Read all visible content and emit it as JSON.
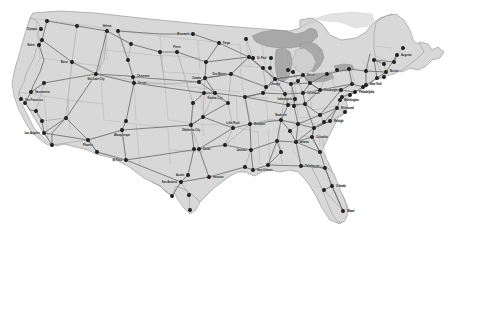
{
  "map": {
    "title": "United States Interstate Highway Map",
    "background_color": "#ffffff",
    "land_color": "#d8d8d8",
    "land_stroke": "#9a9a9a",
    "water_color": "#a8a8a8",
    "water_stroke": "#8c8c8c",
    "state_border_color": "#b2b2b2",
    "interstate_color": "#6e6e6e",
    "highway_color": "#8a8a8a",
    "city_dot_color": "#222222",
    "label_color": "#1a1a1a",
    "projection_note": "conic lower-48"
  },
  "legend": {
    "items": []
  },
  "cities": [
    {
      "name": "Seattle",
      "x": 47,
      "y": 21
    },
    {
      "name": "Olympia",
      "x": 41,
      "y": 29
    },
    {
      "name": "Spokane",
      "x": 77,
      "y": 26
    },
    {
      "name": "Portland",
      "x": 42,
      "y": 40
    },
    {
      "name": "Salem",
      "x": 39,
      "y": 45
    },
    {
      "name": "Boise",
      "x": 72,
      "y": 62
    },
    {
      "name": "Helena",
      "x": 107,
      "y": 31
    },
    {
      "name": "Billings",
      "x": 131,
      "y": 44
    },
    {
      "name": "Great Falls",
      "x": 118,
      "y": 31
    },
    {
      "name": "Bismarck",
      "x": 193,
      "y": 34
    },
    {
      "name": "Fargo",
      "x": 219,
      "y": 43
    },
    {
      "name": "Duluth",
      "x": 246,
      "y": 39
    },
    {
      "name": "Minneapolis",
      "x": 249,
      "y": 57
    },
    {
      "name": "St. Paul",
      "x": 253,
      "y": 58
    },
    {
      "name": "Rapid City",
      "x": 160,
      "y": 52
    },
    {
      "name": "Sioux Falls",
      "x": 206,
      "y": 62
    },
    {
      "name": "Pierre",
      "x": 177,
      "y": 52
    },
    {
      "name": "Casper",
      "x": 128,
      "y": 60
    },
    {
      "name": "Cheyenne",
      "x": 133,
      "y": 77
    },
    {
      "name": "Denver",
      "x": 134,
      "y": 83
    },
    {
      "name": "Salt Lake City",
      "x": 96,
      "y": 74
    },
    {
      "name": "Reno",
      "x": 44,
      "y": 83
    },
    {
      "name": "Sacramento",
      "x": 31,
      "y": 92
    },
    {
      "name": "San Francisco",
      "x": 21,
      "y": 99
    },
    {
      "name": "San Jose",
      "x": 25,
      "y": 103
    },
    {
      "name": "Fresno",
      "x": 36,
      "y": 111
    },
    {
      "name": "Bakersfield",
      "x": 42,
      "y": 121
    },
    {
      "name": "Los Angeles",
      "x": 44,
      "y": 133
    },
    {
      "name": "San Diego",
      "x": 52,
      "y": 145
    },
    {
      "name": "Las Vegas",
      "x": 66,
      "y": 118
    },
    {
      "name": "Phoenix",
      "x": 88,
      "y": 140
    },
    {
      "name": "Tucson",
      "x": 97,
      "y": 152
    },
    {
      "name": "Albuquerque",
      "x": 122,
      "y": 130
    },
    {
      "name": "Santa Fe",
      "x": 126,
      "y": 121
    },
    {
      "name": "El Paso",
      "x": 126,
      "y": 160
    },
    {
      "name": "Omaha",
      "x": 205,
      "y": 78
    },
    {
      "name": "Lincoln",
      "x": 199,
      "y": 82
    },
    {
      "name": "Des Moines",
      "x": 231,
      "y": 74
    },
    {
      "name": "Kansas City",
      "x": 215,
      "y": 93
    },
    {
      "name": "Topeka",
      "x": 204,
      "y": 93
    },
    {
      "name": "Wichita",
      "x": 193,
      "y": 103
    },
    {
      "name": "Oklahoma City",
      "x": 191,
      "y": 125
    },
    {
      "name": "Tulsa",
      "x": 203,
      "y": 117
    },
    {
      "name": "Dallas",
      "x": 199,
      "y": 149
    },
    {
      "name": "Fort Worth",
      "x": 194,
      "y": 149
    },
    {
      "name": "Austin",
      "x": 188,
      "y": 175
    },
    {
      "name": "San Antonio",
      "x": 181,
      "y": 182
    },
    {
      "name": "Houston",
      "x": 209,
      "y": 177
    },
    {
      "name": "Corpus Christi",
      "x": 189,
      "y": 195
    },
    {
      "name": "Laredo",
      "x": 172,
      "y": 196
    },
    {
      "name": "Brownsville",
      "x": 190,
      "y": 210
    },
    {
      "name": "Springfield",
      "x": 228,
      "y": 103
    },
    {
      "name": "St. Louis",
      "x": 245,
      "y": 97
    },
    {
      "name": "Little Rock",
      "x": 233,
      "y": 128
    },
    {
      "name": "Memphis",
      "x": 250,
      "y": 124
    },
    {
      "name": "Jackson",
      "x": 251,
      "y": 150
    },
    {
      "name": "Shreveport",
      "x": 225,
      "y": 145
    },
    {
      "name": "Baton Rouge",
      "x": 245,
      "y": 167
    },
    {
      "name": "New Orleans",
      "x": 253,
      "y": 170
    },
    {
      "name": "Mobile",
      "x": 268,
      "y": 165
    },
    {
      "name": "Birmingham",
      "x": 277,
      "y": 141
    },
    {
      "name": "Montgomery",
      "x": 281,
      "y": 152
    },
    {
      "name": "Nashville",
      "x": 281,
      "y": 120
    },
    {
      "name": "Chattanooga",
      "x": 290,
      "y": 131
    },
    {
      "name": "Atlanta",
      "x": 296,
      "y": 142
    },
    {
      "name": "Savannah",
      "x": 320,
      "y": 152
    },
    {
      "name": "Jacksonville",
      "x": 325,
      "y": 168
    },
    {
      "name": "Orlando",
      "x": 332,
      "y": 186
    },
    {
      "name": "Tampa",
      "x": 324,
      "y": 190
    },
    {
      "name": "Miami",
      "x": 343,
      "y": 211
    },
    {
      "name": "Tallahassee",
      "x": 301,
      "y": 166
    },
    {
      "name": "Columbia",
      "x": 312,
      "y": 137
    },
    {
      "name": "Charlotte",
      "x": 314,
      "y": 128
    },
    {
      "name": "Raleigh",
      "x": 330,
      "y": 121
    },
    {
      "name": "Charleston WV",
      "x": 305,
      "y": 104
    },
    {
      "name": "Richmond",
      "x": 337,
      "y": 108
    },
    {
      "name": "Norfolk",
      "x": 345,
      "y": 112
    },
    {
      "name": "Washington",
      "x": 340,
      "y": 100
    },
    {
      "name": "Baltimore",
      "x": 342,
      "y": 97
    },
    {
      "name": "Philadelphia",
      "x": 355,
      "y": 92
    },
    {
      "name": "Wilmington",
      "x": 350,
      "y": 95
    },
    {
      "name": "New York",
      "x": 366,
      "y": 85
    },
    {
      "name": "Newark",
      "x": 363,
      "y": 87
    },
    {
      "name": "Hartford",
      "x": 377,
      "y": 78
    },
    {
      "name": "Providence",
      "x": 384,
      "y": 77
    },
    {
      "name": "Boston",
      "x": 386,
      "y": 72
    },
    {
      "name": "Albany",
      "x": 366,
      "y": 71
    },
    {
      "name": "Concord",
      "x": 384,
      "y": 64
    },
    {
      "name": "Montpelier",
      "x": 374,
      "y": 60
    },
    {
      "name": "Augusta",
      "x": 397,
      "y": 55
    },
    {
      "name": "Portland ME",
      "x": 394,
      "y": 62
    },
    {
      "name": "Bangor",
      "x": 403,
      "y": 48
    },
    {
      "name": "Buffalo",
      "x": 327,
      "y": 74
    },
    {
      "name": "Rochester",
      "x": 337,
      "y": 70
    },
    {
      "name": "Syracuse",
      "x": 349,
      "y": 69
    },
    {
      "name": "Scranton",
      "x": 352,
      "y": 84
    },
    {
      "name": "Harrisburg",
      "x": 341,
      "y": 90
    },
    {
      "name": "Pittsburgh",
      "x": 320,
      "y": 90
    },
    {
      "name": "Cleveland",
      "x": 310,
      "y": 83
    },
    {
      "name": "Columbus",
      "x": 303,
      "y": 93
    },
    {
      "name": "Cincinnati",
      "x": 295,
      "y": 99
    },
    {
      "name": "Toledo",
      "x": 298,
      "y": 81
    },
    {
      "name": "Detroit",
      "x": 303,
      "y": 75
    },
    {
      "name": "Lansing",
      "x": 293,
      "y": 72
    },
    {
      "name": "Grand Rapids",
      "x": 288,
      "y": 70
    },
    {
      "name": "Indianapolis",
      "x": 285,
      "y": 94
    },
    {
      "name": "Fort Wayne",
      "x": 291,
      "y": 84
    },
    {
      "name": "Chicago",
      "x": 275,
      "y": 79
    },
    {
      "name": "Milwaukee",
      "x": 270,
      "y": 68
    },
    {
      "name": "Madison",
      "x": 263,
      "y": 68
    },
    {
      "name": "Green Bay",
      "x": 271,
      "y": 58
    },
    {
      "name": "Louisville",
      "x": 288,
      "y": 105
    },
    {
      "name": "Lexington",
      "x": 294,
      "y": 106
    },
    {
      "name": "Knoxville",
      "x": 298,
      "y": 124
    },
    {
      "name": "Roanoke",
      "x": 320,
      "y": 115
    },
    {
      "name": "Greensboro",
      "x": 324,
      "y": 122
    },
    {
      "name": "Peoria",
      "x": 266,
      "y": 87
    },
    {
      "name": "Springfield IL",
      "x": 263,
      "y": 93
    }
  ],
  "visible_labels": [
    {
      "name": "Olympia",
      "x": 41,
      "y": 29,
      "anchor": "end",
      "dx": -4,
      "dy": 1
    },
    {
      "name": "Boise",
      "x": 72,
      "y": 62,
      "anchor": "end",
      "dx": -4,
      "dy": 1
    },
    {
      "name": "Salem",
      "x": 39,
      "y": 45,
      "anchor": "end",
      "dx": -4,
      "dy": 1
    },
    {
      "name": "Helena",
      "x": 107,
      "y": 31,
      "anchor": "middle",
      "dx": 0,
      "dy": -4
    },
    {
      "name": "Bismarck",
      "x": 193,
      "y": 34,
      "anchor": "end",
      "dx": -4,
      "dy": 1
    },
    {
      "name": "Fargo",
      "x": 219,
      "y": 43,
      "anchor": "start",
      "dx": 4,
      "dy": 1
    },
    {
      "name": "Pierre",
      "x": 177,
      "y": 52,
      "anchor": "middle",
      "dx": 0,
      "dy": -4
    },
    {
      "name": "Salt Lake City",
      "x": 96,
      "y": 74,
      "anchor": "middle",
      "dx": 0,
      "dy": 6
    },
    {
      "name": "Denver",
      "x": 134,
      "y": 83,
      "anchor": "start",
      "dx": 4,
      "dy": 1
    },
    {
      "name": "Cheyenne",
      "x": 133,
      "y": 77,
      "anchor": "start",
      "dx": 4,
      "dy": 0
    },
    {
      "name": "Sacramento",
      "x": 31,
      "y": 92,
      "anchor": "start",
      "dx": 4,
      "dy": 1
    },
    {
      "name": "San Francisco",
      "x": 21,
      "y": 99,
      "anchor": "start",
      "dx": 4,
      "dy": 2
    },
    {
      "name": "Los Angeles",
      "x": 44,
      "y": 133,
      "anchor": "end",
      "dx": -4,
      "dy": 1
    },
    {
      "name": "Phoenix",
      "x": 88,
      "y": 140,
      "anchor": "middle",
      "dx": 0,
      "dy": 6
    },
    {
      "name": "Albuquerque",
      "x": 122,
      "y": 130,
      "anchor": "middle",
      "dx": 0,
      "dy": 6
    },
    {
      "name": "El Paso",
      "x": 126,
      "y": 160,
      "anchor": "end",
      "dx": -4,
      "dy": 1
    },
    {
      "name": "St. Paul",
      "x": 253,
      "y": 58,
      "anchor": "start",
      "dx": 4,
      "dy": 1
    },
    {
      "name": "Des Moines",
      "x": 231,
      "y": 74,
      "anchor": "end",
      "dx": -4,
      "dy": 1
    },
    {
      "name": "Omaha",
      "x": 205,
      "y": 78,
      "anchor": "end",
      "dx": -4,
      "dy": 1
    },
    {
      "name": "Kansas City",
      "x": 215,
      "y": 93,
      "anchor": "middle",
      "dx": 0,
      "dy": 6
    },
    {
      "name": "Oklahoma City",
      "x": 191,
      "y": 125,
      "anchor": "middle",
      "dx": 0,
      "dy": 6
    },
    {
      "name": "Dallas",
      "x": 199,
      "y": 149,
      "anchor": "start",
      "dx": 4,
      "dy": 1
    },
    {
      "name": "Austin",
      "x": 188,
      "y": 175,
      "anchor": "end",
      "dx": -4,
      "dy": 1
    },
    {
      "name": "San Antonio",
      "x": 181,
      "y": 182,
      "anchor": "end",
      "dx": -4,
      "dy": 1
    },
    {
      "name": "Houston",
      "x": 209,
      "y": 177,
      "anchor": "start",
      "dx": 4,
      "dy": 1
    },
    {
      "name": "Little Rock",
      "x": 233,
      "y": 128,
      "anchor": "middle",
      "dx": 0,
      "dy": -4
    },
    {
      "name": "Memphis",
      "x": 250,
      "y": 124,
      "anchor": "start",
      "dx": 4,
      "dy": 1
    },
    {
      "name": "New Orleans",
      "x": 253,
      "y": 170,
      "anchor": "start",
      "dx": 4,
      "dy": 1
    },
    {
      "name": "Jackson",
      "x": 251,
      "y": 150,
      "anchor": "end",
      "dx": -4,
      "dy": 1
    },
    {
      "name": "Nashville",
      "x": 281,
      "y": 120,
      "anchor": "middle",
      "dx": 0,
      "dy": -4
    },
    {
      "name": "Atlanta",
      "x": 296,
      "y": 142,
      "anchor": "start",
      "dx": 4,
      "dy": 1
    },
    {
      "name": "Tallahassee",
      "x": 301,
      "y": 166,
      "anchor": "start",
      "dx": 4,
      "dy": 1
    },
    {
      "name": "Orlando",
      "x": 332,
      "y": 186,
      "anchor": "start",
      "dx": 4,
      "dy": 1
    },
    {
      "name": "Miami",
      "x": 343,
      "y": 211,
      "anchor": "start",
      "dx": 4,
      "dy": 1
    },
    {
      "name": "Raleigh",
      "x": 330,
      "y": 121,
      "anchor": "start",
      "dx": 4,
      "dy": 1
    },
    {
      "name": "Columbia",
      "x": 312,
      "y": 137,
      "anchor": "start",
      "dx": 4,
      "dy": 1
    },
    {
      "name": "Richmond",
      "x": 337,
      "y": 108,
      "anchor": "start",
      "dx": 4,
      "dy": 1
    },
    {
      "name": "Washington",
      "x": 340,
      "y": 100,
      "anchor": "start",
      "dx": 4,
      "dy": 1
    },
    {
      "name": "Philadelphia",
      "x": 355,
      "y": 92,
      "anchor": "start",
      "dx": 4,
      "dy": 1
    },
    {
      "name": "New York",
      "x": 366,
      "y": 85,
      "anchor": "start",
      "dx": 4,
      "dy": 0
    },
    {
      "name": "Boston",
      "x": 386,
      "y": 72,
      "anchor": "start",
      "dx": 4,
      "dy": 0
    },
    {
      "name": "Augusta",
      "x": 397,
      "y": 55,
      "anchor": "start",
      "dx": 4,
      "dy": 1
    },
    {
      "name": "Detroit",
      "x": 303,
      "y": 75,
      "anchor": "start",
      "dx": 4,
      "dy": 1
    },
    {
      "name": "Chicago",
      "x": 275,
      "y": 79,
      "anchor": "middle",
      "dx": 0,
      "dy": 6
    },
    {
      "name": "Indianapolis",
      "x": 285,
      "y": 94,
      "anchor": "middle",
      "dx": 0,
      "dy": 6
    },
    {
      "name": "Columbus",
      "x": 303,
      "y": 93,
      "anchor": "start",
      "dx": 4,
      "dy": 1
    },
    {
      "name": "Pittsburgh",
      "x": 320,
      "y": 90,
      "anchor": "start",
      "dx": 4,
      "dy": 1
    }
  ],
  "lakes": [
    {
      "name": "Lake Superior"
    },
    {
      "name": "Lake Michigan"
    },
    {
      "name": "Lake Huron"
    },
    {
      "name": "Lake Erie"
    },
    {
      "name": "Lake Ontario"
    }
  ]
}
